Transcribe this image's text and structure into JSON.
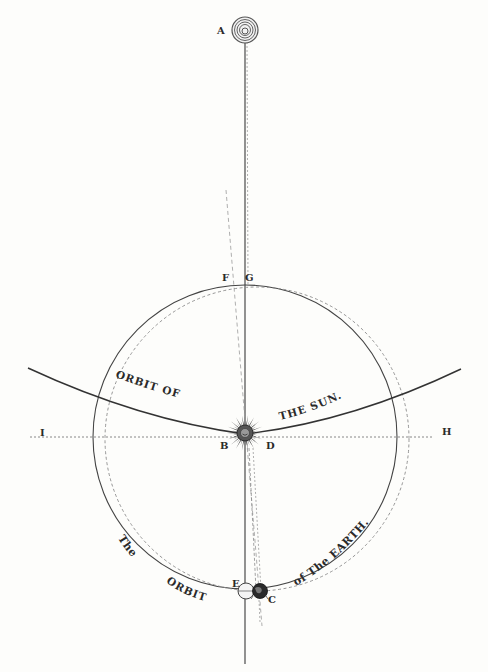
{
  "diagram": {
    "points": {
      "A": "A",
      "B": "B",
      "C": "C",
      "D": "D",
      "E": "E",
      "F": "F",
      "G": "G",
      "H": "H",
      "I": "I"
    },
    "captions": {
      "sun_orbit_left": [
        "O",
        "R",
        "B",
        "I",
        "T",
        " ",
        "O",
        "F"
      ],
      "sun_orbit_left_text": "ORBIT OF",
      "sun_orbit_right_text": "THE SUN.",
      "earth_orbit_left_the": "The",
      "earth_orbit_left_orbit": "ORBIT",
      "earth_orbit_right_text": "of The EARTH."
    },
    "bodies": [
      {
        "id": "A",
        "icon": "distant-star-concentric-rings"
      },
      {
        "id": "sun",
        "icon": "radiant-sun-with-face"
      },
      {
        "id": "E",
        "icon": "earth-light-globe"
      },
      {
        "id": "C",
        "icon": "earth-dark-globe"
      }
    ],
    "colors": {
      "ink": "#2b2b2b",
      "dashed": "#8a8a8a",
      "paper": "#fdfdfb"
    }
  }
}
